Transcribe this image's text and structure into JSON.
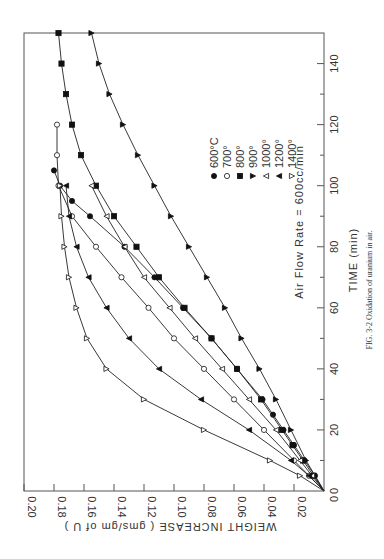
{
  "figure": {
    "caption": "FIG. 3-2 Oxidation of uranium in air.",
    "annotation": "Air Flow Rate = 600cc/min"
  },
  "chart_data": {
    "type": "line",
    "title": "Oxidation of uranium in air",
    "orientation": "rotated 90° clockwise (time axis vertical on right, weight axis horizontal on bottom)",
    "xlabel": "TIME  (min)",
    "ylabel": "WEIGHT  INCREASE  ( gms/gm of U )",
    "xlim": [
      0,
      150
    ],
    "ylim": [
      0,
      0.2
    ],
    "xticks": [
      "0",
      "20",
      "40",
      "60",
      "80",
      "100",
      "120",
      "140"
    ],
    "yticks": [
      "0.02",
      "0.04",
      "0.06",
      "0.08",
      "0.10",
      "0.12",
      "0.14",
      "0.16",
      "0.18",
      "0.20"
    ],
    "grid": false,
    "annotation": "Air Flow Rate = 600cc/min",
    "legend": [
      "600°C",
      "700°",
      "800°",
      "900°",
      "1000°",
      "1200°",
      "1400°"
    ],
    "series": [
      {
        "name": "600°C",
        "marker": "filled-circle",
        "x": [
          0,
          5,
          10,
          15,
          20,
          25,
          30,
          40,
          50,
          60,
          70,
          80,
          90,
          95,
          100,
          105
        ],
        "y": [
          0,
          0.006,
          0.013,
          0.02,
          0.027,
          0.034,
          0.041,
          0.058,
          0.075,
          0.094,
          0.113,
          0.133,
          0.156,
          0.168,
          0.176,
          0.18
        ]
      },
      {
        "name": "700°",
        "marker": "open-circle",
        "x": [
          0,
          5,
          10,
          20,
          30,
          40,
          50,
          60,
          70,
          80,
          90,
          100,
          110,
          120
        ],
        "y": [
          0,
          0.01,
          0.02,
          0.04,
          0.06,
          0.08,
          0.1,
          0.117,
          0.135,
          0.152,
          0.168,
          0.177,
          0.178,
          0.178
        ]
      },
      {
        "name": "800°",
        "marker": "filled-square",
        "x": [
          0,
          5,
          10,
          15,
          20,
          30,
          40,
          50,
          60,
          70,
          80,
          90,
          100,
          110,
          120,
          130,
          140,
          150
        ],
        "y": [
          0,
          0.007,
          0.014,
          0.021,
          0.028,
          0.042,
          0.058,
          0.075,
          0.093,
          0.11,
          0.125,
          0.14,
          0.152,
          0.162,
          0.168,
          0.172,
          0.175,
          0.177
        ]
      },
      {
        "name": "900°",
        "marker": "filled-triangle",
        "x": [
          0,
          10,
          20,
          30,
          40,
          50,
          60,
          70,
          80,
          90,
          100,
          110,
          120,
          130,
          140,
          150
        ],
        "y": [
          0,
          0.012,
          0.022,
          0.032,
          0.043,
          0.055,
          0.066,
          0.078,
          0.09,
          0.102,
          0.113,
          0.124,
          0.134,
          0.143,
          0.15,
          0.155
        ]
      },
      {
        "name": "1000°",
        "marker": "open-triangle-down",
        "x": [
          0,
          5,
          10,
          20,
          30,
          40,
          50,
          60,
          70,
          80,
          90,
          100
        ],
        "y": [
          0,
          0.008,
          0.016,
          0.032,
          0.05,
          0.068,
          0.086,
          0.103,
          0.12,
          0.133,
          0.145,
          0.155
        ]
      },
      {
        "name": "1200°",
        "marker": "filled-triangle-down",
        "x": [
          0,
          5,
          10,
          20,
          30,
          40,
          50,
          60,
          70,
          80,
          90,
          100
        ],
        "y": [
          0,
          0.01,
          0.022,
          0.05,
          0.082,
          0.11,
          0.13,
          0.145,
          0.157,
          0.165,
          0.17,
          0.172
        ]
      },
      {
        "name": "1400°",
        "marker": "open-triangle",
        "x": [
          0,
          5,
          10,
          20,
          30,
          40,
          50,
          60,
          70,
          80,
          90,
          100
        ],
        "y": [
          0,
          0.016,
          0.036,
          0.08,
          0.12,
          0.145,
          0.158,
          0.165,
          0.17,
          0.173,
          0.175,
          0.176
        ]
      }
    ]
  }
}
